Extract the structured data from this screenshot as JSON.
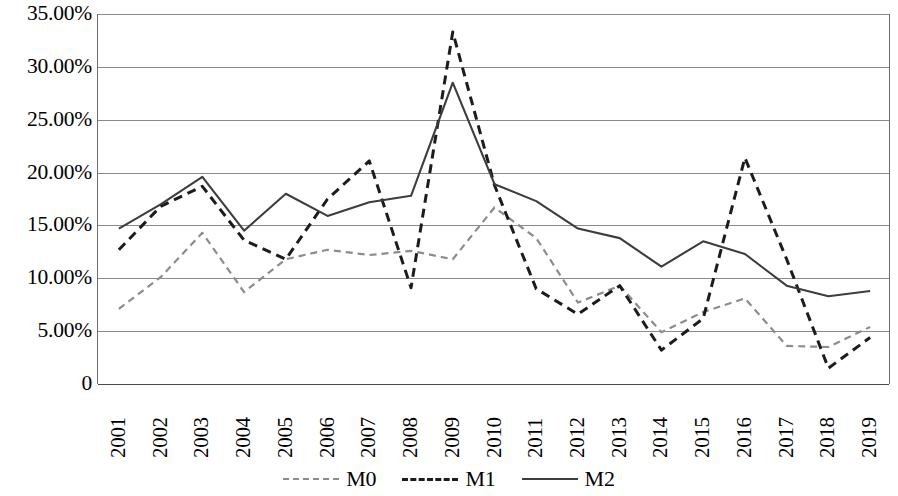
{
  "chart_data": {
    "type": "line",
    "title": "",
    "xlabel": "",
    "ylabel": "",
    "grid": true,
    "legend_position": "bottom",
    "ylim": [
      0,
      35
    ],
    "ytick_labels": [
      "35.00%",
      "30.00%",
      "25.00%",
      "20.00%",
      "15.00%",
      "10.00%",
      "5.00%",
      "0"
    ],
    "ytick_values": [
      35,
      30,
      25,
      20,
      15,
      10,
      5,
      0
    ],
    "categories": [
      "2001",
      "2002",
      "2003",
      "2004",
      "2005",
      "2006",
      "2007",
      "2008",
      "2009",
      "2010",
      "2011",
      "2012",
      "2013",
      "2014",
      "2015",
      "2016",
      "2017",
      "2018",
      "2019"
    ],
    "series": [
      {
        "name": "M0",
        "style": "dotted",
        "color": "#8c8c8c",
        "values": [
          7.1,
          10.1,
          14.3,
          8.7,
          11.8,
          12.7,
          12.2,
          12.6,
          11.8,
          16.7,
          13.8,
          7.7,
          9.3,
          4.9,
          6.8,
          8.1,
          3.6,
          3.5,
          5.4
        ]
      },
      {
        "name": "M1",
        "style": "dashed",
        "color": "#1c1c1c",
        "values": [
          12.7,
          16.8,
          18.7,
          13.6,
          11.8,
          17.5,
          21.1,
          9.1,
          33.3,
          18.8,
          9.0,
          6.6,
          9.3,
          3.2,
          6.2,
          21.4,
          11.8,
          1.5,
          4.4
        ]
      },
      {
        "name": "M2",
        "style": "solid",
        "color": "#3d3d3d",
        "values": [
          14.7,
          17.0,
          19.6,
          14.5,
          18.0,
          15.9,
          17.2,
          17.8,
          28.5,
          18.9,
          17.3,
          14.7,
          13.8,
          11.1,
          13.5,
          12.3,
          9.3,
          8.3,
          8.8
        ]
      }
    ]
  },
  "legend": {
    "items": [
      {
        "label": "M0",
        "swatch": "dotted-line-swatch"
      },
      {
        "label": "M1",
        "swatch": "dashed-line-swatch"
      },
      {
        "label": "M2",
        "swatch": "solid-line-swatch"
      }
    ]
  }
}
